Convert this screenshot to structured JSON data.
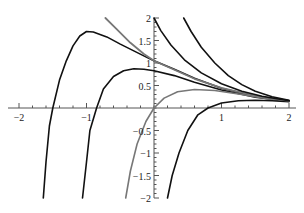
{
  "chart_data": {
    "type": "line",
    "title": "",
    "xlabel": "",
    "ylabel": "",
    "xlim": [
      -2,
      2
    ],
    "ylim": [
      -2,
      2
    ],
    "grid": false,
    "legend": null,
    "x_ticks": [
      -2,
      -1,
      1,
      2
    ],
    "x_tick_labels": [
      "−2",
      "−1",
      "1",
      "2"
    ],
    "y_ticks": [
      -2,
      -1.5,
      -1,
      -0.5,
      0.5,
      1,
      1.5,
      2
    ],
    "y_tick_labels": [
      "−2",
      "−1.5",
      "−1",
      "−0.5",
      "0.5",
      "1",
      "1.5",
      "2"
    ],
    "series": [
      {
        "name": "curve-1",
        "color": "#111111",
        "width": 1.6,
        "points": [
          [
            -1.64,
            -2
          ],
          [
            -1.6,
            -1.2
          ],
          [
            -1.55,
            -0.4
          ],
          [
            -1.5,
            0
          ],
          [
            -1.4,
            0.62
          ],
          [
            -1.3,
            1.05
          ],
          [
            -1.2,
            1.38
          ],
          [
            -1.1,
            1.6
          ],
          [
            -1.0,
            1.7
          ],
          [
            -0.9,
            1.69
          ],
          [
            -0.7,
            1.58
          ],
          [
            -0.5,
            1.42
          ],
          [
            -0.3,
            1.27
          ],
          [
            -0.1,
            1.12
          ],
          [
            0,
            1.05
          ],
          [
            0.3,
            0.86
          ],
          [
            0.6,
            0.66
          ],
          [
            1.0,
            0.44
          ],
          [
            1.5,
            0.26
          ],
          [
            2.0,
            0.16
          ]
        ]
      },
      {
        "name": "curve-2",
        "color": "#111111",
        "width": 1.6,
        "points": [
          [
            -1.06,
            -2
          ],
          [
            -1.0,
            -1.2
          ],
          [
            -0.95,
            -0.5
          ],
          [
            -0.85,
            0
          ],
          [
            -0.75,
            0.42
          ],
          [
            -0.6,
            0.7
          ],
          [
            -0.45,
            0.83
          ],
          [
            -0.3,
            0.87
          ],
          [
            -0.15,
            0.86
          ],
          [
            0,
            0.83
          ],
          [
            0.3,
            0.72
          ],
          [
            0.6,
            0.57
          ],
          [
            1.0,
            0.4
          ],
          [
            1.5,
            0.24
          ],
          [
            2.0,
            0.15
          ]
        ]
      },
      {
        "name": "curve-3-gray",
        "color": "#777777",
        "width": 1.6,
        "points": [
          [
            -0.42,
            -2
          ],
          [
            -0.35,
            -1.4
          ],
          [
            -0.25,
            -0.8
          ],
          [
            -0.12,
            -0.3
          ],
          [
            0,
            0
          ],
          [
            0.15,
            0.22
          ],
          [
            0.35,
            0.36
          ],
          [
            0.6,
            0.41
          ],
          [
            0.9,
            0.39
          ],
          [
            1.3,
            0.3
          ],
          [
            1.7,
            0.2
          ],
          [
            2.0,
            0.15
          ]
        ]
      },
      {
        "name": "curve-4",
        "color": "#111111",
        "width": 1.6,
        "points": [
          [
            0.2,
            -2
          ],
          [
            0.27,
            -1.5
          ],
          [
            0.37,
            -1.0
          ],
          [
            0.5,
            -0.5
          ],
          [
            0.65,
            -0.15
          ],
          [
            0.8,
            0
          ],
          [
            1.0,
            0.11
          ],
          [
            1.25,
            0.16
          ],
          [
            1.5,
            0.17
          ],
          [
            1.75,
            0.16
          ],
          [
            2.0,
            0.14
          ]
        ]
      },
      {
        "name": "curve-5-gray-upper",
        "color": "#777777",
        "width": 1.8,
        "points": [
          [
            -0.72,
            2
          ],
          [
            -0.55,
            1.75
          ],
          [
            -0.35,
            1.45
          ],
          [
            -0.15,
            1.2
          ],
          [
            0,
            1.05
          ],
          [
            0.3,
            0.85
          ],
          [
            0.6,
            0.65
          ],
          [
            1.0,
            0.45
          ],
          [
            1.5,
            0.27
          ],
          [
            2.0,
            0.16
          ]
        ]
      },
      {
        "name": "curve-6",
        "color": "#111111",
        "width": 1.6,
        "points": [
          [
            0,
            2
          ],
          [
            0.1,
            1.72
          ],
          [
            0.25,
            1.4
          ],
          [
            0.45,
            1.07
          ],
          [
            0.7,
            0.78
          ],
          [
            1.0,
            0.54
          ],
          [
            1.3,
            0.37
          ],
          [
            1.6,
            0.26
          ],
          [
            2.0,
            0.16
          ]
        ]
      },
      {
        "name": "curve-7",
        "color": "#111111",
        "width": 1.6,
        "points": [
          [
            0.44,
            2
          ],
          [
            0.55,
            1.7
          ],
          [
            0.7,
            1.35
          ],
          [
            0.9,
            1.0
          ],
          [
            1.1,
            0.72
          ],
          [
            1.3,
            0.52
          ],
          [
            1.5,
            0.37
          ],
          [
            1.75,
            0.25
          ],
          [
            2.0,
            0.17
          ]
        ]
      }
    ]
  }
}
